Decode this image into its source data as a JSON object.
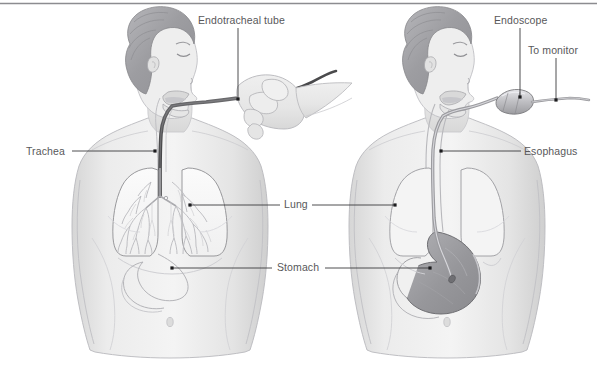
{
  "figure": {
    "title_bar": "top-rule",
    "background_color": "#ffffff",
    "rule_color": "#8c8c90",
    "label_color": "#58585a",
    "leader_color": "#3a3a3c",
    "skin_light": "#ebebeb",
    "skin_mid": "#dedede",
    "skin_shade": "#cfcfcf",
    "hair_dark": "#9a9a9e",
    "hair_mid": "#b3b3b7",
    "organ_outline": "#8e8e92",
    "lung_fill": "#f6f6f6",
    "bronchi_color": "#b9b9bd",
    "stomach_fill": "#9b9b9f",
    "tube_dark": "#4a4a4c",
    "tube_mid": "#7c7c80",
    "scope_body": "#c4c4c8"
  },
  "panels": [
    {
      "id": "left-panel",
      "name": "endotracheal-intubation",
      "description": "Woman in profile with endotracheal tube passing through mouth into trachea toward lungs; a gloved hand holds the tube."
    },
    {
      "id": "right-panel",
      "name": "upper-endoscopy",
      "description": "Woman in profile with endoscope passing through mouth into esophagus and down into the stomach; cable runs to monitor."
    }
  ],
  "labels": [
    {
      "id": "endotracheal-tube",
      "text": "Endotracheal tube",
      "x": 198,
      "y": 14,
      "panel": "left"
    },
    {
      "id": "trachea",
      "text": "Trachea",
      "x": 26,
      "y": 145,
      "panel": "left"
    },
    {
      "id": "lung",
      "text": "Lung",
      "x": 284,
      "y": 198,
      "panel": "both"
    },
    {
      "id": "stomach",
      "text": "Stomach",
      "x": 277,
      "y": 261,
      "panel": "both"
    },
    {
      "id": "endoscope",
      "text": "Endoscope",
      "x": 494,
      "y": 14,
      "panel": "right"
    },
    {
      "id": "to-monitor",
      "text": "To monitor",
      "x": 528,
      "y": 44,
      "panel": "right"
    },
    {
      "id": "esophagus",
      "text": "Esophagus",
      "x": 524,
      "y": 145,
      "panel": "right"
    }
  ],
  "leaders": [
    {
      "id": "leader-endotracheal-tube",
      "points": "238,28 238,99",
      "dot": "238,99"
    },
    {
      "id": "leader-trachea",
      "points": "72,151 155,151",
      "dot": "155,151"
    },
    {
      "id": "leader-lung-left",
      "points": "190,205 280,205",
      "dot": "190,205"
    },
    {
      "id": "leader-lung-right",
      "points": "312,205 395,205",
      "dot": "395,205"
    },
    {
      "id": "leader-stomach-left",
      "points": "172,268 272,268",
      "dot": "172,268"
    },
    {
      "id": "leader-stomach-right",
      "points": "325,268 430,268",
      "dot": "430,268"
    },
    {
      "id": "leader-endoscope",
      "points": "520,28 520,97",
      "dot": "520,97"
    },
    {
      "id": "leader-to-monitor",
      "points": "556,58 556,100",
      "dot": "556,100"
    },
    {
      "id": "leader-esophagus",
      "points": "441,151 521,151",
      "dot": "441,151"
    }
  ]
}
